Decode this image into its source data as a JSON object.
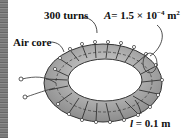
{
  "figure": {
    "labels": {
      "turns": "300 turns",
      "area_symbol": "A",
      "area_value": "= 1.5 × 10",
      "area_exp": "−4",
      "area_unit": " m",
      "area_unit_exp": "2",
      "core": "Air core",
      "length_symbol": "l",
      "length_value": " = 0.1 m"
    },
    "colors": {
      "torus_fill": "#b8b8b8",
      "torus_shade": "#8c8c8c",
      "winding": "#333333",
      "text": "#111111",
      "background": "#ffffff"
    }
  }
}
